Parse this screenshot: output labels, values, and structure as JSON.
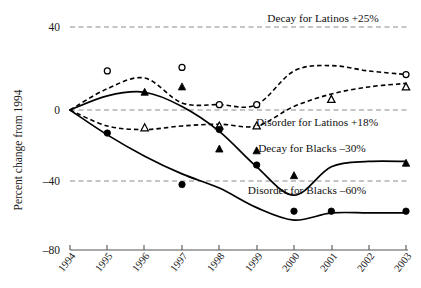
{
  "chart_data": {
    "type": "line",
    "title": "",
    "xlabel": "",
    "ylabel": "Percent change from 1994",
    "x": [
      1994,
      1995,
      1996,
      1997,
      1998,
      1999,
      2000,
      2001,
      2002,
      2003
    ],
    "xticklabels": [
      "1994",
      "1995",
      "1996",
      "1997",
      "1998",
      "1999",
      "2000",
      "2001",
      "2002",
      "2003"
    ],
    "yticklabels": [
      "40",
      "0",
      "–40",
      "–80"
    ],
    "yticks": [
      40,
      0,
      -40,
      -80
    ],
    "ylim": [
      -80,
      45
    ],
    "grid": "horizontal dashed gridlines at 40, 0, -40",
    "legend": "inline annotations at end of each series",
    "series": [
      {
        "name": "Decay for Latinos +25%",
        "marker": "open-circle",
        "linestyle": "dashed",
        "label_text": "Decay for Latinos +25%",
        "values": [
          0,
          12,
          18,
          4,
          3,
          3,
          22,
          25,
          22,
          20
        ],
        "marker_points": [
          {
            "x": 1995,
            "y": 22
          },
          {
            "x": 1997,
            "y": 24
          },
          {
            "x": 1998,
            "y": 3
          },
          {
            "x": 1999,
            "y": 3
          },
          {
            "x": 2003,
            "y": 20
          }
        ]
      },
      {
        "name": "Disorder for Latinos +18%",
        "marker": "open-triangle",
        "linestyle": "dashed",
        "label_text": "Disorder for Latinos +18%",
        "values": [
          0,
          -9,
          -11,
          -9,
          -8,
          -9,
          2,
          9,
          13,
          15
        ],
        "marker_points": [
          {
            "x": 1996,
            "y": -10
          },
          {
            "x": 1998,
            "y": -9
          },
          {
            "x": 1999,
            "y": -9
          },
          {
            "x": 2001,
            "y": 6
          },
          {
            "x": 2003,
            "y": 13
          }
        ]
      },
      {
        "name": "Decay for Blacks –30%",
        "marker": "filled-triangle",
        "linestyle": "solid",
        "label_text": "Decay for Blacks –30%",
        "values": [
          0,
          8,
          10,
          2,
          -12,
          -32,
          -48,
          -32,
          -29,
          -29
        ],
        "marker_points": [
          {
            "x": 1996,
            "y": 10
          },
          {
            "x": 1997,
            "y": 13
          },
          {
            "x": 1998,
            "y": -22
          },
          {
            "x": 1999,
            "y": -23
          },
          {
            "x": 2000,
            "y": -37
          },
          {
            "x": 2003,
            "y": -30
          }
        ]
      },
      {
        "name": "Disorder for Blacks –60%",
        "marker": "filled-circle",
        "linestyle": "solid",
        "label_text": "Disorder for Blacks –60%",
        "values": [
          0,
          -14,
          -26,
          -36,
          -44,
          -55,
          -62,
          -58,
          -58,
          -58
        ],
        "marker_points": [
          {
            "x": 1995,
            "y": -13
          },
          {
            "x": 1997,
            "y": -42
          },
          {
            "x": 1998,
            "y": -11
          },
          {
            "x": 1999,
            "y": -31
          },
          {
            "x": 2000,
            "y": -57
          },
          {
            "x": 2001,
            "y": -57
          },
          {
            "x": 2003,
            "y": -57
          }
        ]
      }
    ]
  },
  "annotations": {
    "decay_latinos": "Decay for Latinos +25%",
    "disorder_latinos": "Disorder for Latinos +18%",
    "decay_blacks": "Decay for Blacks –30%",
    "disorder_blacks": "Disorder for Blacks –60%"
  },
  "axes": {
    "y_title": "Percent change from 1994",
    "y_labels": [
      "40",
      "0",
      "–40",
      "–80"
    ],
    "x_labels": [
      "1994",
      "1995",
      "1996",
      "1997",
      "1998",
      "1999",
      "2000",
      "2001",
      "2002",
      "2003"
    ]
  },
  "colors": {
    "line": "#000000",
    "grid": "#8a8a8a",
    "axis": "#555555",
    "background": "#ffffff"
  }
}
